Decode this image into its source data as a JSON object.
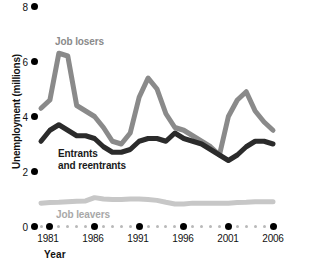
{
  "chart_data": {
    "type": "line",
    "title": "",
    "xlabel": "Year",
    "ylabel": "Unemployment (millions)",
    "xlim": [
      1980,
      2006
    ],
    "ylim": [
      0,
      8
    ],
    "grid": false,
    "legend_position": "inline-labels",
    "y_ticks": [
      "0",
      "2",
      "4",
      "6",
      "8"
    ],
    "y_tick_values": [
      0,
      2,
      4,
      6,
      8
    ],
    "x_ticks": [
      "1981",
      "1986",
      "1991",
      "1996",
      "2001",
      "2006"
    ],
    "x_tick_values": [
      1981,
      1986,
      1991,
      1996,
      2001,
      2006
    ],
    "x": [
      1980,
      1981,
      1982,
      1983,
      1984,
      1985,
      1986,
      1987,
      1988,
      1989,
      1990,
      1991,
      1992,
      1993,
      1994,
      1995,
      1996,
      1997,
      1998,
      1999,
      2000,
      2001,
      2002,
      2003,
      2004,
      2005,
      2006
    ],
    "series": [
      {
        "name": "Job losers",
        "color": "#8a8a8a",
        "values": [
          4.3,
          4.6,
          6.3,
          6.2,
          4.4,
          4.2,
          4.0,
          3.6,
          3.1,
          3.0,
          3.4,
          4.7,
          5.4,
          5.0,
          4.1,
          3.6,
          3.5,
          3.3,
          3.1,
          2.9,
          2.6,
          4.0,
          4.6,
          4.9,
          4.2,
          3.8,
          3.5
        ]
      },
      {
        "name": "Entrants and reentrants",
        "color": "#2b2b2b",
        "values": [
          3.1,
          3.5,
          3.7,
          3.5,
          3.3,
          3.3,
          3.2,
          2.9,
          2.7,
          2.7,
          2.8,
          3.1,
          3.2,
          3.2,
          3.1,
          3.4,
          3.2,
          3.1,
          3.0,
          2.8,
          2.6,
          2.4,
          2.6,
          2.9,
          3.1,
          3.1,
          3.0
        ]
      },
      {
        "name": "Job leavers",
        "color": "#c7c7c7",
        "values": [
          0.85,
          0.87,
          0.88,
          0.9,
          0.92,
          0.93,
          1.05,
          1.0,
          0.98,
          0.98,
          1.0,
          1.0,
          0.98,
          0.95,
          0.88,
          0.82,
          0.82,
          0.85,
          0.85,
          0.85,
          0.85,
          0.85,
          0.87,
          0.88,
          0.9,
          0.9,
          0.9
        ]
      }
    ],
    "annotations": [
      {
        "text": "Job losers",
        "color": "#8a8a8a",
        "x": 1982,
        "y": 6.9
      },
      {
        "text": "Entrants",
        "color": "#1a1a1a",
        "x": 1983,
        "y": 2.6
      },
      {
        "text": "and reentrants",
        "color": "#1a1a1a",
        "x": 1983,
        "y": 2.35
      },
      {
        "text": "Job leavers",
        "color": "#a8a8a8",
        "x": 1982,
        "y": 0.35
      }
    ]
  },
  "labels": {
    "job_losers": "Job losers",
    "entrants_line1": "Entrants",
    "entrants_line2": "and reentrants",
    "job_leavers": "Job leavers",
    "y_axis_title": "Unemployment (millions)",
    "x_axis_title": "Year",
    "y_tick_0": "0",
    "y_tick_2": "2",
    "y_tick_4": "4",
    "y_tick_6": "6",
    "y_tick_8": "8",
    "x_tick_1981": "1981",
    "x_tick_1986": "1986",
    "x_tick_1991": "1991",
    "x_tick_1996": "1996",
    "x_tick_2001": "2001",
    "x_tick_2006": "2006"
  },
  "colors": {
    "job_losers": "#8a8a8a",
    "entrants": "#2b2b2b",
    "job_leavers": "#c7c7c7",
    "axis_dot": "#000000",
    "minor_dot": "#b9b9b9",
    "background": "#ffffff"
  }
}
